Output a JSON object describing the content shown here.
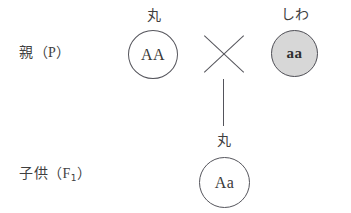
{
  "diagram": {
    "rows": [
      {
        "label_main": "親",
        "label_paren_open": "（",
        "label_gen": "P",
        "label_paren_close": "）"
      },
      {
        "label_main": "子供",
        "label_paren_open": "（",
        "label_gen": "F",
        "label_gen_sub": "1",
        "label_paren_close": "）"
      }
    ],
    "parent_left": {
      "phenotype": "丸",
      "genotype": "AA",
      "fill": "#ffffff",
      "stroke": "#55555c"
    },
    "parent_right": {
      "phenotype": "しわ",
      "genotype": "aa",
      "fill": "#d7d7d7",
      "stroke": "#4e4e55"
    },
    "offspring": {
      "phenotype": "丸",
      "genotype": "Aa",
      "fill": "#ffffff",
      "stroke": "#55555c"
    },
    "cross_symbol": "×",
    "line_color": "#54545b",
    "background": "#ffffff"
  }
}
